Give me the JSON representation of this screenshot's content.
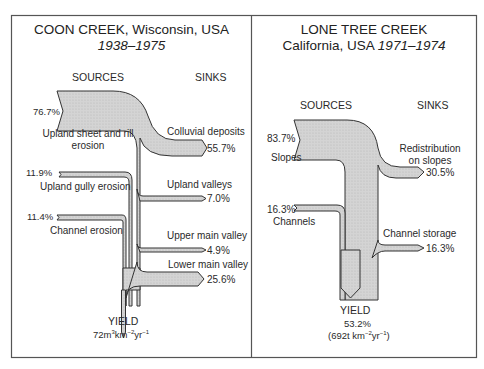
{
  "panels": [
    {
      "title": "COON CREEK, Wisconsin, USA",
      "period": "1938–1975",
      "sources_label": "SOURCES",
      "sinks_label": "SINKS",
      "sources": [
        {
          "label": "Upland sheet and rill erosion",
          "label_line1": "Upland sheet and rill",
          "label_line2": "erosion",
          "value": "76.7%"
        },
        {
          "label": "Upland gully erosion",
          "value": "11.9%"
        },
        {
          "label": "Channel erosion",
          "value": "11.4%"
        }
      ],
      "sinks": [
        {
          "label": "Colluvial deposits",
          "value": "55.7%"
        },
        {
          "label": "Upland valleys",
          "value": "7.0%"
        },
        {
          "label": "Upper main valley",
          "value": "4.9%"
        },
        {
          "label": "Lower main valley",
          "value": "25.6%"
        }
      ],
      "yield": {
        "label": "YIELD",
        "value_base": "72m",
        "value_sup1": "3",
        "value_mid": "km",
        "value_sup2": "−2",
        "value_mid2": "yr",
        "value_sup3": "−1"
      }
    },
    {
      "title": "LONE TREE CREEK",
      "subtitle": "California, USA",
      "period": "1971–1974",
      "sources_label": "SOURCES",
      "sinks_label": "SINKS",
      "sources": [
        {
          "label": "Slopes",
          "value": "83.7%"
        },
        {
          "label": "Channels",
          "value": "16.3%"
        }
      ],
      "sinks": [
        {
          "label": "Redistribution on slopes",
          "label_line1": "Redistribution",
          "label_line2": "on slopes",
          "value": "30.5%"
        },
        {
          "label": "Channel storage",
          "value": "16.3%"
        }
      ],
      "yield": {
        "label": "YIELD",
        "percent": "53.2%",
        "value_base": "(692t km",
        "value_sup1": "−2",
        "value_mid": "yr",
        "value_sup2": "−1",
        "value_end": ")"
      }
    }
  ],
  "colors": {
    "flow_fill": "#d2d2d2",
    "outline": "#333333",
    "border": "#555555"
  }
}
